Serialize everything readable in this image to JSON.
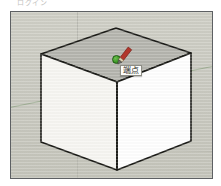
{
  "app": {
    "name": "3D modeling viewport",
    "header_text": "ログイン"
  },
  "viewport": {
    "label": "3d-model-viewport",
    "background_color": "#cdcdc4",
    "frame_border_color": "#5d6063"
  },
  "axes": [
    {
      "name": "green-axis",
      "color": "#97a98c",
      "orientation": "horizontal-receding"
    },
    {
      "name": "blue-axis",
      "color": "#b7b7ae",
      "orientation": "vertical"
    },
    {
      "name": "red-axis",
      "color": "#b9b9af",
      "orientation": "horizontal"
    }
  ],
  "model": {
    "shape": "cube",
    "faces": [
      {
        "name": "top-face",
        "fill": "#b5b5ae",
        "label": "top"
      },
      {
        "name": "left-face",
        "fill": "#f7f6f2",
        "label": "left"
      },
      {
        "name": "right-face",
        "fill": "#ffffff",
        "label": "right"
      }
    ],
    "edge_color": "#1c1c18"
  },
  "inference": {
    "tooltip_text": "端点",
    "tooltip_meaning": "endpoint",
    "snap_marker": {
      "name": "endpoint-dot",
      "color": "#3f9c28"
    }
  },
  "cursor": {
    "tool": "pencil",
    "tool_label": "Line tool",
    "body_color": "#b2362c",
    "tip_color": "#6d6d66"
  }
}
